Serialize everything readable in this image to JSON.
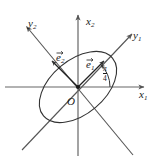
{
  "figure": {
    "kind": "vector-diagram",
    "colors": {
      "axis": "#555555",
      "curve": "#333333",
      "text": "#1a1a1a",
      "background": "#ffffff"
    },
    "origin": {
      "x": 78,
      "y": 87
    }
  },
  "labels": {
    "x_axis": {
      "text": "x",
      "sub": "1"
    },
    "y_axis_vertical": {
      "text": "x",
      "sub": "2"
    },
    "rotated_axis_right": {
      "text": "y",
      "sub": "1"
    },
    "rotated_axis_left": {
      "text": "y",
      "sub": "2"
    },
    "basis_vector_1": {
      "text": "e",
      "sub": "1"
    },
    "basis_vector_2": {
      "text": "e",
      "sub": "2"
    },
    "origin": {
      "text": "O"
    },
    "angle": {
      "numerator": "π",
      "denominator": "4",
      "value_radians": 0.7853981634,
      "value_degrees": 45
    }
  },
  "geometry": {
    "axes": {
      "x1": {
        "from": [
          4,
          87
        ],
        "to": [
          146,
          87
        ],
        "arrow": "end"
      },
      "x2": {
        "from": [
          78,
          155
        ],
        "to": [
          78,
          13
        ],
        "arrow": "end"
      },
      "y1": {
        "from": [
          148,
          148
        ],
        "to": [
          133,
          33
        ],
        "arrow": "end"
      },
      "y2": {
        "from": [
          133,
          155
        ],
        "to": [
          25,
          25
        ],
        "arrow": "end"
      }
    },
    "ellipse": {
      "center": [
        78,
        87
      ],
      "semi_major": 45,
      "semi_minor": 27,
      "rotation_degrees": -40
    },
    "angle_arc": {
      "center": [
        78,
        87
      ],
      "radius": 32,
      "start_degrees": 0,
      "end_degrees": 45
    },
    "vectors": [
      {
        "name": "e1",
        "from": [
          78,
          87
        ],
        "to": [
          105,
          60
        ]
      },
      {
        "name": "e2",
        "from": [
          78,
          87
        ],
        "to": [
          51,
          60
        ]
      }
    ]
  }
}
